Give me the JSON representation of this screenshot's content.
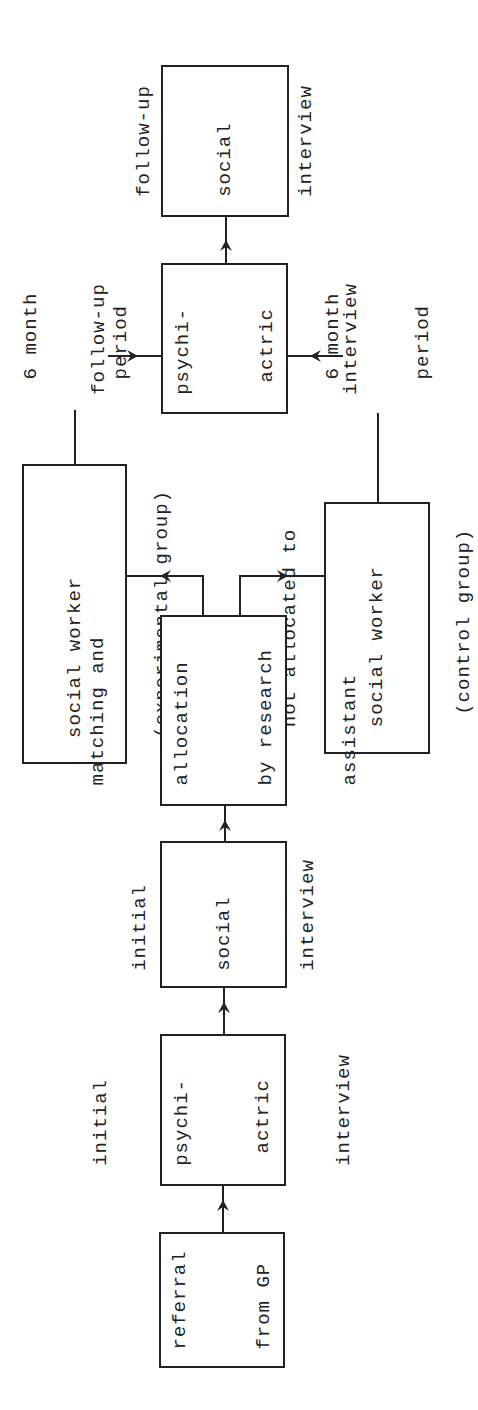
{
  "diagram": {
    "type": "flowchart",
    "orientation": "rotated-90-ccw",
    "nodes": {
      "referral": {
        "lines": [
          "referral",
          "from GP"
        ]
      },
      "initial_psych": {
        "lines": [
          "initial",
          "psychi-",
          " actric",
          "interview"
        ]
      },
      "initial_social": {
        "lines": [
          "initial",
          "social",
          "interview"
        ]
      },
      "matching": {
        "lines": [
          "matching and",
          "allocation",
          "by research",
          "assistant"
        ]
      },
      "experimental": {
        "lines": [
          "allocated to",
          "social worker",
          "(experimental group)"
        ]
      },
      "control": {
        "lines": [
          "not allocated to",
          "social worker",
          " (control group)"
        ]
      },
      "followup_psych": {
        "lines": [
          "follow-up",
          "psychi-",
          " actric",
          "interview"
        ]
      },
      "followup_social": {
        "lines": [
          "follow-up",
          "social",
          "interview"
        ]
      }
    },
    "labels": {
      "period_left": {
        "lines": [
          "6 month",
          "period"
        ]
      },
      "period_right": {
        "lines": [
          "6 month",
          "period"
        ]
      }
    },
    "edges": [
      {
        "from": "referral",
        "to": "initial_psych"
      },
      {
        "from": "initial_psych",
        "to": "initial_social"
      },
      {
        "from": "initial_social",
        "to": "matching"
      },
      {
        "from": "matching",
        "to": "experimental"
      },
      {
        "from": "matching",
        "to": "control"
      },
      {
        "from": "experimental",
        "to": "followup_psych",
        "label": "6 month period"
      },
      {
        "from": "control",
        "to": "followup_psych",
        "label": "6 month period"
      },
      {
        "from": "followup_psych",
        "to": "followup_social"
      }
    ],
    "colors": {
      "stroke": "#222222",
      "background": "#ffffff"
    }
  }
}
